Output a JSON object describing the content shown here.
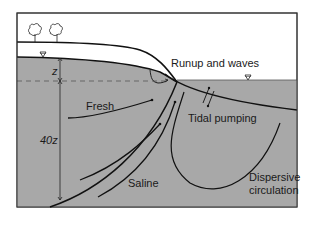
{
  "diagram": {
    "title": "",
    "labels": {
      "runup": "Runup and waves",
      "fresh": "Fresh",
      "tidal": "Tidal pumping",
      "saline": "Saline",
      "dispersive_1": "Dispersive",
      "dispersive_2": "circulation",
      "z": "z",
      "forty_z": "40z"
    },
    "icons": [
      "tree-icon",
      "tree-icon",
      "water-table-triangle-icon",
      "sea-level-triangle-icon"
    ],
    "colors": {
      "saturated_zone": "#a8a8a8",
      "unsaturated_zone": "#ffffff",
      "lines": "#111111",
      "frame": "#333333"
    }
  }
}
